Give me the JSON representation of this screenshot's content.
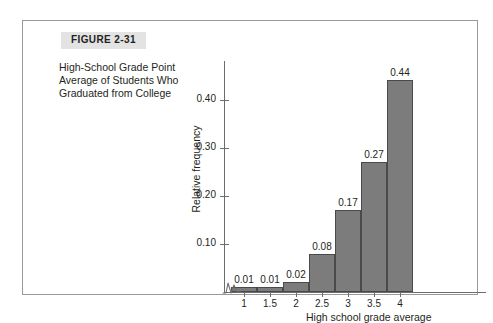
{
  "figure": {
    "number_label": "FIGURE 2-31",
    "caption": "High-School Grade Point Average of Students Who Graduated from College"
  },
  "chart_data": {
    "type": "bar",
    "title": "",
    "xlabel": "High school grade average",
    "ylabel": "Relative frequency",
    "categories": [
      "1",
      "1.5",
      "2",
      "2.5",
      "3",
      "3.5",
      "4"
    ],
    "bin_edges": [
      0.75,
      1.25,
      1.75,
      2.25,
      2.75,
      3.25,
      3.75,
      4.25
    ],
    "values": [
      0.01,
      0.01,
      0.02,
      0.08,
      0.17,
      0.27,
      0.44
    ],
    "bar_labels": [
      "0.01",
      "0.01",
      "0.02",
      "0.08",
      "0.17",
      "0.27",
      "0.44"
    ],
    "ylim": [
      0,
      0.48
    ],
    "yticks": [
      0.1,
      0.2,
      0.3,
      0.4
    ],
    "ytick_labels": [
      "0.10",
      "0.20",
      "0.30",
      "0.40"
    ],
    "xticks": [
      1,
      1.5,
      2,
      2.5,
      3,
      3.5,
      4
    ],
    "xtick_labels": [
      "1",
      "1.5",
      "2",
      "2.5",
      "3",
      "3.5",
      "4"
    ],
    "grid": false,
    "legend": false,
    "axis_break": true,
    "bar_color": "#7c7c7c",
    "bar_edge_color": "#4a4a4a",
    "axis_color": "#6d6d6d"
  }
}
